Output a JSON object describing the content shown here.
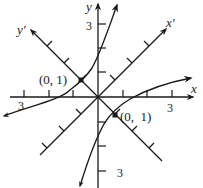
{
  "diagram": {
    "axes": {
      "x_label": "x",
      "y_label": "y",
      "x_prime_label": "x'",
      "y_prime_label": "y'",
      "x_tick_range": [
        -3,
        3
      ],
      "y_tick_range": [
        -3,
        3
      ],
      "rotation_degrees": 45
    },
    "tick_labels": {
      "x_neg": "3",
      "x_pos": "3",
      "y_pos": "3",
      "y_neg": "3"
    },
    "points": [
      {
        "label": "(0, 1)",
        "position_desc": "on y' axis, upper-left quadrant"
      },
      {
        "label": "(0,  1)",
        "position_desc": "on y' axis, lower-right quadrant"
      }
    ],
    "colors": {
      "stroke": "#1a1a1a",
      "background": "#ffffff"
    }
  }
}
